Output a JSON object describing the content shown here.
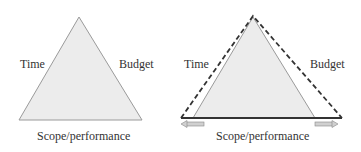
{
  "left_diagram": {
    "labels": {
      "left": "Time",
      "right": "Budget",
      "bottom": "Scope/performance"
    }
  },
  "right_diagram": {
    "labels": {
      "left": "Time",
      "right": "Budget",
      "bottom": "Scope/performance"
    }
  },
  "colors": {
    "fill": "#ececec",
    "stroke": "#9a9a9a",
    "dashed": "#333333",
    "arrow": "#bdbdbd"
  }
}
